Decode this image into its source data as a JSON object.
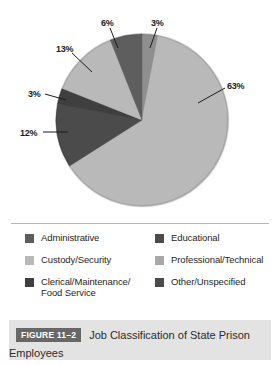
{
  "figure": {
    "badge": "FIGURE 11–2",
    "caption": "Job Classification of State Prison Employees"
  },
  "chart_data": {
    "type": "pie",
    "title": "Job Classification of State Prison Employees",
    "unit": "percent",
    "legend_position": "below",
    "grid": false,
    "categories": [
      "Custody/Security",
      "Clerical/Maintenance/Food Service",
      "Administrative",
      "Professional/Technical",
      "Educational",
      "Other/Unspecified"
    ],
    "values": [
      63,
      12,
      3,
      13,
      6,
      3
    ],
    "slices": [
      {
        "label": "Other/Unspecified",
        "value": 3,
        "display": "3%",
        "color": "#8f8f8f",
        "start_deg": 0,
        "end_deg": 10.8
      },
      {
        "label": "Custody/Security",
        "value": 63,
        "display": "63%",
        "color": "#b9b9b9",
        "start_deg": 10.8,
        "end_deg": 237.6
      },
      {
        "label": "Clerical/Maintenance/Food Service",
        "value": 12,
        "display": "12%",
        "color": "#4b4b4b",
        "start_deg": 237.6,
        "end_deg": 280.8
      },
      {
        "label": "Administrative",
        "value": 3,
        "display": "3%",
        "color": "#3f3f3f",
        "start_deg": 280.8,
        "end_deg": 291.6
      },
      {
        "label": "Professional/Technical",
        "value": 13,
        "display": "13%",
        "color": "#b9b9b9",
        "start_deg": 291.6,
        "end_deg": 338.4
      },
      {
        "label": "Educational",
        "value": 6,
        "display": "6%",
        "color": "#5e5e5e",
        "start_deg": 338.4,
        "end_deg": 360
      }
    ],
    "data_labels": [
      {
        "text": "6%",
        "x": 101,
        "y": 18
      },
      {
        "text": "3%",
        "x": 151,
        "y": 18
      },
      {
        "text": "13%",
        "x": 56,
        "y": 44
      },
      {
        "text": "3%",
        "x": 28,
        "y": 89
      },
      {
        "text": "12%",
        "x": 20,
        "y": 128
      },
      {
        "text": "63%",
        "x": 227,
        "y": 81
      }
    ]
  },
  "legend": {
    "left": [
      {
        "label": "Administrative",
        "label2": "",
        "color": "#5e5e5e"
      },
      {
        "label": "Custody/Security",
        "label2": "",
        "color": "#b9b9b9"
      },
      {
        "label": "Clerical/Maintenance/",
        "label2": "Food Service",
        "color": "#3f3f3f"
      }
    ],
    "right": [
      {
        "label": "Educational",
        "label2": "",
        "color": "#4b4b4b"
      },
      {
        "label": "Professional/Technical",
        "label2": "",
        "color": "#a8a8a8"
      },
      {
        "label": "Other/Unspecified",
        "label2": "",
        "color": "#4b4b4b"
      }
    ]
  },
  "colors": {
    "page_background": "#ffffff",
    "divider": "#b6b6b6",
    "caption_band": "#e3e3e3",
    "badge_background": "#676767",
    "badge_text": "#ffffff",
    "text": "#262626",
    "pie_shadow": "#8d8d8d"
  }
}
